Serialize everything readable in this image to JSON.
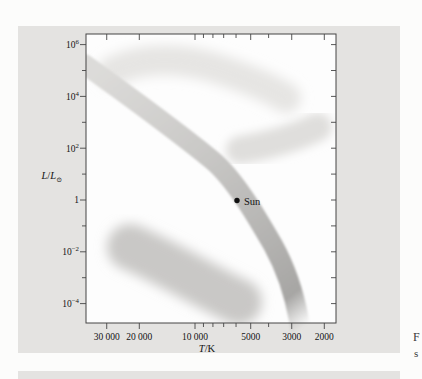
{
  "page": {
    "background": "#fcfcfb"
  },
  "figure_box": {
    "background": "#e4e3e1"
  },
  "caption_edge": {
    "line1": "F",
    "line2": "s"
  },
  "chart_data": {
    "type": "area",
    "title": "",
    "xlabel": "T/K",
    "ylabel": "L/L⊙",
    "grid": false,
    "legend": "none",
    "x_axis": {
      "scale": "log",
      "reversed": true,
      "domain_K": [
        38800,
        1730
      ],
      "label_parts": {
        "symbol": "T",
        "rest": "/K"
      },
      "ticks": [
        {
          "value": 30000,
          "label": "30 000"
        },
        {
          "value": 20000,
          "label": "20 000"
        },
        {
          "value": 10000,
          "label": "10 000"
        },
        {
          "value": 9000
        },
        {
          "value": 8000
        },
        {
          "value": 7000
        },
        {
          "value": 6000
        },
        {
          "value": 5000,
          "label": "5000"
        },
        {
          "value": 4000
        },
        {
          "value": 3000,
          "label": "3000"
        },
        {
          "value": 2000,
          "label": "2000"
        }
      ],
      "px": {
        "ref_value": 10000,
        "x_at_ref": 195,
        "per_decade": 185
      }
    },
    "y_axis": {
      "scale": "log",
      "domain": [
        2e-05,
        2500000.0
      ],
      "label_parts": {
        "num": "L",
        "slash": "/",
        "den": "L",
        "sub": "⊙"
      },
      "ticks": [
        {
          "value": 1000000.0,
          "base": "10",
          "exp": "6"
        },
        {
          "value": 100000.0
        },
        {
          "value": 10000.0,
          "base": "10",
          "exp": "4"
        },
        {
          "value": 1000.0
        },
        {
          "value": 100.0,
          "base": "10",
          "exp": "2"
        },
        {
          "value": 10
        },
        {
          "value": 1,
          "label": "1"
        },
        {
          "value": 0.1
        },
        {
          "value": 0.01,
          "base": "10",
          "exp": "−2"
        },
        {
          "value": 0.001
        },
        {
          "value": 0.0001,
          "base": "10",
          "exp": "−4"
        }
      ],
      "px": {
        "ref_value": 1,
        "y_at_ref": 200,
        "per_decade": 25.9
      }
    },
    "plot_px": {
      "left": 86,
      "top": 34,
      "right": 336,
      "bottom": 323
    },
    "sun": {
      "label": "Sun",
      "temperature_K": 5800,
      "luminosity_solar": 1,
      "px": {
        "x": 237,
        "y": 200.5,
        "r": 2.7,
        "label_x": 244,
        "label_y": 204.5
      }
    },
    "regions": [
      {
        "name": "main-sequence-band",
        "style": "gradient-band-fading-at-cool-end",
        "px_path": "M 84 64 C 130 97 175 130 212 160 C 235 179 258 219 273 245 C 288 272 295 298 299 320 C 301 332 301 340 301 348",
        "stroke_width": 20,
        "gradient": [
          "#dcdbd9",
          "#cac9c7",
          "#b4b3b1",
          "#a7a6a4"
        ]
      },
      {
        "name": "supergiants-region",
        "color": "#e6e5e3",
        "px_path": "M 112 72 C 140 57 180 57 218 69 C 248 79 272 89 286 98",
        "stroke_width": 30
      },
      {
        "name": "giants-region",
        "color": "#dfdedc",
        "px_path": "M 240 150 C 265 146 295 138 318 127",
        "stroke_width": 28
      },
      {
        "name": "white-dwarfs-region",
        "color": "#c9c8c6",
        "px_path": "M 130 247 C 166 262 206 287 239 302",
        "stroke_width": 46
      }
    ]
  }
}
